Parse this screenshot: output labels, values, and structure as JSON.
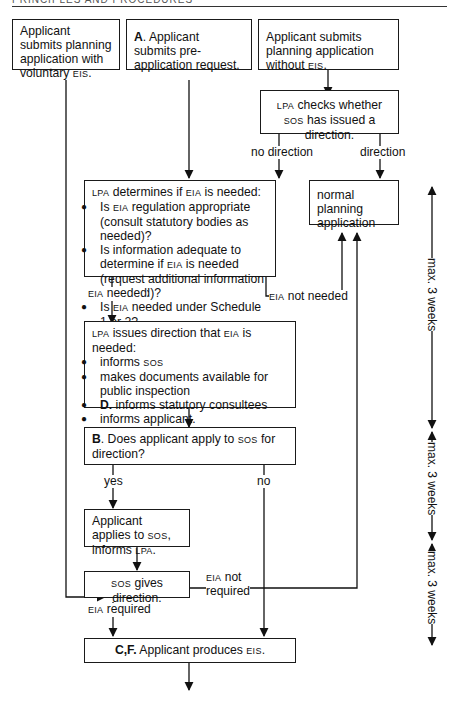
{
  "header": {
    "running_title": "PRINCIPLES AND PROCEDURES"
  },
  "boxes": {
    "voluntary_eis": {
      "text_pre": "Applicant submits planning application with voluntary ",
      "abbr": "EIS",
      "text_post": "."
    },
    "pre_application": {
      "bold": "A",
      "text": ". Applicant submits pre-application request."
    },
    "without_eis": {
      "text_pre": "Applicant submits planning application without ",
      "abbr": "EIS",
      "text_post": "."
    },
    "lpa_checks": {
      "abbr1": "LPA",
      "t1": " checks whether ",
      "abbr2": "SOS",
      "t2": " has issued a direction."
    },
    "normal_planning": {
      "text": "normal planning application"
    },
    "lpa_determines": {
      "abbr1": "LPA",
      "t1": " determines if ",
      "abbr2": "EIA",
      "t2": " is needed:",
      "bullets": [
        {
          "pre": "Is ",
          "abbr": "EIA",
          "post": " regulation appropriate (consult statutory bodies as needed)?"
        },
        {
          "pre": "Is information adequate to determine if ",
          "abbr": "EIA",
          "post": " is needed (request additional information if needed)?"
        },
        {
          "pre": "Is ",
          "abbr": "EIA",
          "post": " needed under Schedule 1 or 2?"
        }
      ]
    },
    "lpa_issues": {
      "abbr1": "LPA",
      "t1": " issues direction that ",
      "abbr2": "EIA",
      "t2": " is needed:",
      "bullets": [
        {
          "pre": "informs ",
          "abbr": "SOS",
          "post": ""
        },
        {
          "pre": "makes documents available for public inspection",
          "abbr": "",
          "post": ""
        },
        {
          "bold": "D.",
          "pre": " informs statutory consultees",
          "abbr": "",
          "post": ""
        },
        {
          "pre": "informs applicant.",
          "abbr": "",
          "post": ""
        }
      ]
    },
    "apply_sos": {
      "bold": "B",
      "t1": ". Does applicant apply to ",
      "abbr": "SOS",
      "t2": " for direction?"
    },
    "applicant_applies": {
      "t1": "Applicant applies to ",
      "abbr1": "SOS",
      "t2": ", informs ",
      "abbr2": "LPA",
      "t3": "."
    },
    "sos_gives": {
      "abbr": "SOS",
      "t": " gives direction."
    },
    "produces_eis": {
      "bold": "C,F.",
      "t": " Applicant produces ",
      "abbr": "EIS",
      "t2": "."
    }
  },
  "edge_labels": {
    "no_direction": "no direction",
    "direction": "direction",
    "eia_needed_abbr": "EIA",
    "eia_needed": " needed",
    "eia_not_needed_abbr": "EIA",
    "eia_not_needed": " not needed",
    "yes": "yes",
    "no": "no",
    "eia_not_required_abbr": "EIA",
    "eia_not_required_1": " not",
    "eia_not_required_2": "required",
    "eia_required_abbr": "EIA",
    "eia_required": " required"
  },
  "timeline": {
    "segments": [
      "max. 3 weeks",
      "max. 3 weeks",
      "max. 3 weeks"
    ]
  }
}
